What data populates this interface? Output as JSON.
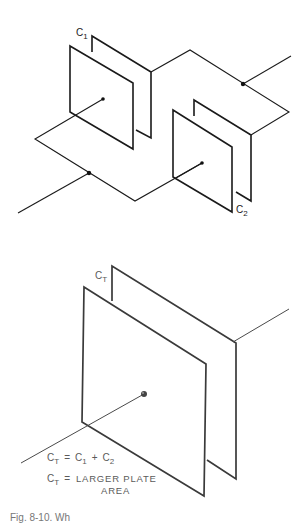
{
  "top_diagram": {
    "description": "Two capacitors C1 and C2 connected in parallel",
    "labels": {
      "c1": {
        "main": "C",
        "sub": "1"
      },
      "c2": {
        "main": "C",
        "sub": "2"
      }
    }
  },
  "bottom_diagram": {
    "description": "Equivalent single capacitor CT with larger plate area",
    "labels": {
      "ct": {
        "main": "C",
        "sub": "T"
      }
    },
    "equation_1": {
      "lhs_main": "C",
      "lhs_sub": "T",
      "eq": "=",
      "t1_main": "C",
      "t1_sub": "1",
      "plus": "+",
      "t2_main": "C",
      "t2_sub": "2"
    },
    "equation_2": {
      "lhs_main": "C",
      "lhs_sub": "T",
      "eq": "=",
      "line1": "LARGER PLATE",
      "line2": "AREA"
    }
  },
  "caption": {
    "text": "Fig. 8-10. Wh"
  },
  "colors": {
    "line": "#1a1a1a",
    "soft_text": "#5a5a5a",
    "background": "#ffffff"
  }
}
